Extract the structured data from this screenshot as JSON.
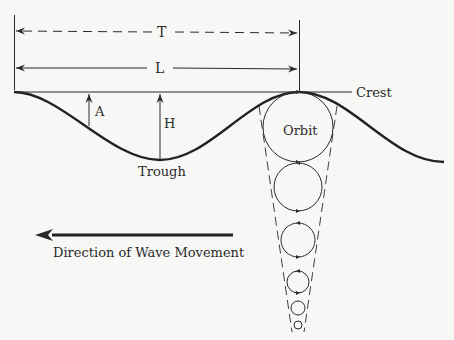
{
  "diagram": {
    "labels": {
      "period": "T",
      "wavelength": "L",
      "amplitude": "A",
      "height": "H",
      "crest": "Crest",
      "trough": "Trough",
      "orbit": "Orbit",
      "direction": "Direction of Wave Movement"
    },
    "colors": {
      "background": "#f7f7f6",
      "ink": "#2a2a2a"
    },
    "orbits": [
      {
        "cx": 298,
        "cy": 127,
        "r": 35
      },
      {
        "cx": 298,
        "cy": 187,
        "r": 24
      },
      {
        "cx": 298,
        "cy": 240,
        "r": 17
      },
      {
        "cx": 298,
        "cy": 282,
        "r": 11
      },
      {
        "cx": 298,
        "cy": 308,
        "r": 7
      },
      {
        "cx": 298,
        "cy": 325,
        "r": 4
      }
    ]
  }
}
